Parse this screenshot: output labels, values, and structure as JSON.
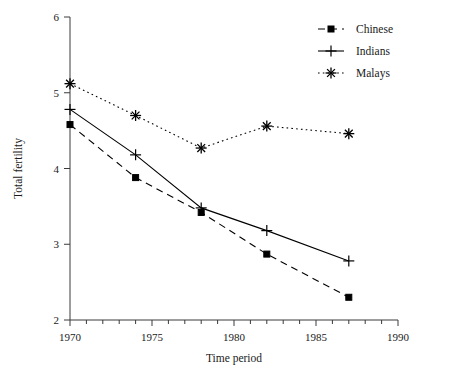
{
  "chart_data": {
    "type": "line",
    "title": "",
    "xlabel": "Time period",
    "ylabel": "Total fertility",
    "x": [
      1970,
      1974,
      1978,
      1982,
      1987
    ],
    "xlim": [
      1970,
      1990
    ],
    "ylim": [
      2,
      6
    ],
    "xticks": [
      1970,
      1975,
      1980,
      1985,
      1990
    ],
    "xticklabels": [
      "1970",
      "1975",
      "1980",
      "1985",
      "1990"
    ],
    "xminorticks": [
      1971,
      1972,
      1973,
      1974,
      1976,
      1977,
      1978,
      1979,
      1981,
      1982,
      1983,
      1984,
      1986,
      1987,
      1988,
      1989
    ],
    "yticks": [
      2,
      3,
      4,
      5,
      6
    ],
    "yticklabels": [
      "2",
      "3",
      "4",
      "5",
      "6"
    ],
    "grid": false,
    "legend_position": "top-right",
    "series": [
      {
        "name": "Chinese",
        "marker": "square",
        "linestyle": "dashed",
        "color": "#000000",
        "values": [
          4.58,
          3.88,
          3.42,
          2.87,
          2.3
        ]
      },
      {
        "name": "Indians",
        "marker": "plus",
        "linestyle": "solid",
        "color": "#000000",
        "values": [
          4.78,
          4.18,
          3.48,
          3.18,
          2.78
        ]
      },
      {
        "name": "Malays",
        "marker": "asterisk",
        "linestyle": "dotted",
        "color": "#000000",
        "values": [
          5.12,
          4.7,
          4.27,
          4.56,
          4.46
        ]
      }
    ]
  },
  "legend": {
    "entries": [
      {
        "label": "Chinese"
      },
      {
        "label": "Indians"
      },
      {
        "label": "Malays"
      }
    ]
  },
  "axes": {
    "x_title": "Time period",
    "y_title": "Total fertility"
  }
}
